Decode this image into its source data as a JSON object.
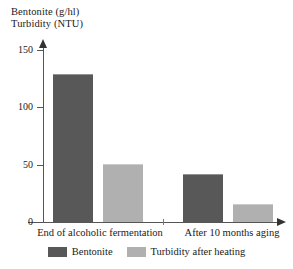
{
  "chart_data": {
    "type": "bar",
    "title": "",
    "title_lines": [
      "Bentonite (g/hl)",
      "Turbidity (NTU)"
    ],
    "xlabel": "",
    "ylabel": "Bentonite (g/hl) / Turbidity (NTU)",
    "categories": [
      "End of alcoholic fermentation",
      "After 10 months aging"
    ],
    "series": [
      {
        "name": "Bentonite",
        "color": "#585858",
        "values": [
          129,
          42
        ]
      },
      {
        "name": "Turbidity after heating",
        "color": "#b0b0b0",
        "values": [
          51,
          16
        ]
      }
    ],
    "ylim": [
      0,
      150
    ],
    "yticks": [
      0,
      50,
      100,
      150
    ],
    "ytick_labels": [
      "0",
      "50",
      "100",
      "150"
    ],
    "grid": false,
    "legend_position": "bottom"
  },
  "axis": {
    "tick_0": "0",
    "tick_50": "50",
    "tick_100": "100",
    "tick_150": "150"
  },
  "categories": {
    "c0": "End of alcoholic fermentation",
    "c1": "After 10 months aging"
  },
  "legend": {
    "items": [
      {
        "label": "Bentonite",
        "color": "#585858"
      },
      {
        "label": "Turbidity after heating",
        "color": "#b0b0b0"
      }
    ],
    "label_0": "Bentonite",
    "label_1": "Turbidity after heating"
  },
  "colors": {
    "bentonite": "#585858",
    "turbidity": "#b0b0b0",
    "axis": "#555555",
    "text": "#1a1a1a",
    "background": "#ffffff"
  }
}
